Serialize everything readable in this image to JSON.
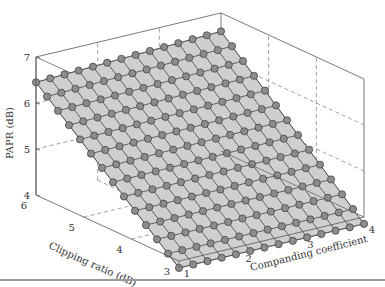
{
  "chart_data": {
    "type": "surface3d",
    "title": "",
    "xlabel": "Companding coefficient",
    "ylabel": "Clipping ratio (dB)",
    "zlabel": "PAPR (dB)",
    "x_ticks": [
      "1",
      "2",
      "3",
      "4"
    ],
    "y_ticks": [
      "3",
      "4",
      "5",
      "6"
    ],
    "z_ticks": [
      "4",
      "5",
      "6",
      "7"
    ],
    "xlim": [
      1,
      4
    ],
    "ylim": [
      3,
      6
    ],
    "zlim": [
      4,
      7
    ],
    "grid": true,
    "grid_points_per_axis": 14,
    "corner_values": {
      "clip6_comp1": 6.45,
      "clip6_comp4": 6.6,
      "clip3_comp1": 3.85,
      "clip3_comp4": 3.85
    },
    "marker": {
      "shape": "circle",
      "fill": "#8c8c8c",
      "stroke": "#3a3a3a"
    },
    "surface_fill": "#cfcfcf"
  },
  "labels": {
    "zlabel": "PAPR (dB)",
    "ylabel": "Clipping ratio (dB)",
    "xlabel": "Companding coefficient"
  }
}
